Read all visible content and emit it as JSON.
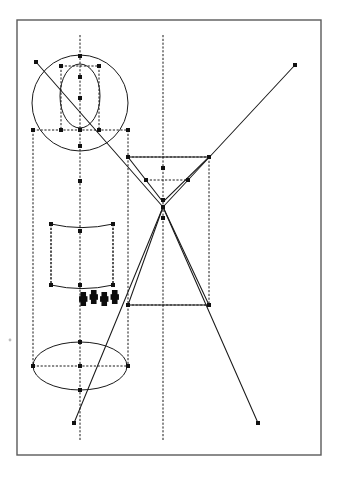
{
  "document": {
    "title": "Geometric construction line drawing",
    "kind": "technical-line-diagram",
    "background_color": "#ffffff",
    "frame": {
      "x": 17,
      "y": 20,
      "width": 304,
      "height": 435,
      "stroke_color": "#5a5a5a",
      "stroke_width": 1.4,
      "fill": "#ffffff"
    },
    "colors": {
      "line": "#1a1a1a",
      "node": "#111111",
      "frame": "#5a5a5a",
      "hatch": "#0d0d0d",
      "speck": "#bdbdbd"
    },
    "style": {
      "node_size": 4.0,
      "dash_pattern": "2.2 1.6",
      "line_width": 1.05
    }
  },
  "geometry": {
    "axes": [
      {
        "name": "left-center-axis",
        "type": "vertical-dashed",
        "x": 80,
        "y1": 35,
        "y2": 440
      },
      {
        "name": "right-center-axis",
        "type": "vertical-dashed",
        "x": 163,
        "y1": 35,
        "y2": 440
      }
    ],
    "construction_verticals": [
      {
        "name": "left-outer-vertical",
        "x": 33,
        "y1": 130,
        "y2": 366
      },
      {
        "name": "left-inner-vertical",
        "x": 61,
        "y1": 66,
        "y2": 130
      },
      {
        "name": "right-inner-vertical",
        "x": 99,
        "y1": 66,
        "y2": 130
      },
      {
        "name": "right-outer-vertical",
        "x": 128,
        "y1": 130,
        "y2": 366
      },
      {
        "name": "barrel-left-vertical",
        "x": 51,
        "y1": 224,
        "y2": 285
      },
      {
        "name": "barrel-right-vertical",
        "x": 113,
        "y1": 224,
        "y2": 285
      },
      {
        "name": "right-box-vertical",
        "x": 209,
        "y1": 157,
        "y2": 305
      }
    ],
    "horizontals": [
      {
        "name": "upper-chord",
        "x1": 33,
        "x2": 128,
        "y": 130
      },
      {
        "name": "upper-small-chord",
        "x1": 61,
        "x2": 99,
        "y": 66
      },
      {
        "name": "right-box-top",
        "x1": 128,
        "x2": 209,
        "y": 157
      },
      {
        "name": "right-inner-chord",
        "x1": 146,
        "x2": 188,
        "y": 180
      },
      {
        "name": "right-box-bottom",
        "x1": 128,
        "x2": 209,
        "y": 305
      },
      {
        "name": "lower-ellipse-chord",
        "x1": 33,
        "x2": 128,
        "y": 366
      }
    ],
    "circles": [
      {
        "name": "large-circle",
        "cx": 80,
        "cy": 103,
        "r": 48
      },
      {
        "name": "small-dome-arc",
        "cx": 80,
        "cy": 96,
        "rx": 20,
        "ry": 32,
        "note": "upper lens/dome"
      }
    ],
    "ellipses": [
      {
        "name": "lower-ellipse",
        "cx": 80,
        "cy": 366,
        "rx": 47,
        "ry": 24
      }
    ],
    "barrel": {
      "name": "middle-barrel",
      "left": 51,
      "right": 113,
      "top": 224,
      "bottom": 285,
      "waist_offset": 6
    },
    "triangles": [
      {
        "name": "inverted-triangle",
        "points": "128,157 209,157 163,202"
      },
      {
        "name": "upright-triangle",
        "points": "163,207 128,305 209,305"
      }
    ],
    "diagonals": [
      {
        "name": "diagonal-upper-left",
        "x1": 36,
        "y1": 62,
        "x2": 163,
        "y2": 207
      },
      {
        "name": "diagonal-top-right",
        "x1": 163,
        "y1": 207,
        "x2": 295,
        "y2": 65
      },
      {
        "name": "diagonal-bottom-left",
        "x1": 163,
        "y1": 207,
        "x2": 74,
        "y2": 423
      },
      {
        "name": "diagonal-bottom-right",
        "x1": 163,
        "y1": 207,
        "x2": 258,
        "y2": 423
      }
    ],
    "hatch_marks": {
      "name": "cross-hatch-cluster",
      "x": 78,
      "y": 291,
      "width": 42,
      "height": 14,
      "count": 4
    },
    "nodes": [
      {
        "name": "node-top-apex",
        "x": 80,
        "y": 56
      },
      {
        "name": "node-upper-left-handle",
        "x": 61,
        "y": 66
      },
      {
        "name": "node-upper-right-handle",
        "x": 99,
        "y": 66
      },
      {
        "name": "node-circle-top",
        "x": 80,
        "y": 77
      },
      {
        "name": "node-axis-mid-upper",
        "x": 80,
        "y": 98
      },
      {
        "name": "node-chord-left-inner",
        "x": 61,
        "y": 130
      },
      {
        "name": "node-chord-right-inner",
        "x": 99,
        "y": 130
      },
      {
        "name": "node-chord-left-outer",
        "x": 33,
        "y": 130
      },
      {
        "name": "node-chord-right-outer",
        "x": 128,
        "y": 130
      },
      {
        "name": "node-chord-center",
        "x": 80,
        "y": 130
      },
      {
        "name": "node-lens-bottom",
        "x": 80,
        "y": 146
      },
      {
        "name": "node-circle-bottom",
        "x": 80,
        "y": 181
      },
      {
        "name": "node-barrel-top-left",
        "x": 51,
        "y": 224
      },
      {
        "name": "node-barrel-top-right",
        "x": 113,
        "y": 224
      },
      {
        "name": "node-barrel-top-center",
        "x": 80,
        "y": 231
      },
      {
        "name": "node-barrel-bottom-left",
        "x": 51,
        "y": 285
      },
      {
        "name": "node-barrel-bottom-right",
        "x": 113,
        "y": 285
      },
      {
        "name": "node-barrel-bottom-center",
        "x": 80,
        "y": 285
      },
      {
        "name": "node-ellipse-top",
        "x": 80,
        "y": 342
      },
      {
        "name": "node-ellipse-left",
        "x": 33,
        "y": 366
      },
      {
        "name": "node-ellipse-right",
        "x": 128,
        "y": 366
      },
      {
        "name": "node-ellipse-center",
        "x": 80,
        "y": 366
      },
      {
        "name": "node-ellipse-bottom",
        "x": 80,
        "y": 390
      },
      {
        "name": "node-diagonal-start-upper-left",
        "x": 36,
        "y": 62
      },
      {
        "name": "node-diagonal-end-top-right",
        "x": 295,
        "y": 65
      },
      {
        "name": "node-diagonal-end-bottom-left",
        "x": 74,
        "y": 423
      },
      {
        "name": "node-diagonal-end-bottom-right",
        "x": 258,
        "y": 423
      },
      {
        "name": "node-box-top-left",
        "x": 128,
        "y": 157
      },
      {
        "name": "node-box-top-right",
        "x": 209,
        "y": 157
      },
      {
        "name": "node-inner-chord-left",
        "x": 146,
        "y": 180
      },
      {
        "name": "node-inner-chord-right",
        "x": 188,
        "y": 180
      },
      {
        "name": "node-axis-upper-tri",
        "x": 163,
        "y": 168
      },
      {
        "name": "node-tri-apex-down",
        "x": 163,
        "y": 200
      },
      {
        "name": "node-crossing-center",
        "x": 163,
        "y": 207
      },
      {
        "name": "node-axis-below-cross",
        "x": 163,
        "y": 218
      },
      {
        "name": "node-box-bottom-left",
        "x": 128,
        "y": 305
      },
      {
        "name": "node-box-bottom-right",
        "x": 209,
        "y": 305
      }
    ],
    "specks": [
      {
        "name": "left-margin-speck",
        "x": 10,
        "y": 340,
        "r": 1.4
      }
    ]
  }
}
